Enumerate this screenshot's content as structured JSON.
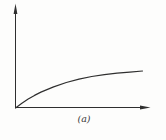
{
  "figure": {
    "caption": "(a)",
    "background": "#fdfdfc",
    "line_color": "#2f2f2f"
  },
  "chart_data": {
    "type": "line",
    "title": "",
    "xlabel": "",
    "ylabel": "",
    "caption": "(a)",
    "grid": false,
    "ticks": false,
    "legend": false,
    "x_range": [
      0,
      1
    ],
    "y_range": [
      0,
      1
    ],
    "axis_style": "arrows-from-origin",
    "series": [
      {
        "name": "saturating-curve",
        "description": "monotonic curve rising from origin and leveling off",
        "x": [
          0,
          0.05,
          0.1,
          0.15,
          0.2,
          0.3,
          0.4,
          0.5,
          0.6,
          0.7,
          0.8,
          0.9,
          1.0
        ],
        "y": [
          0,
          0.13,
          0.24,
          0.34,
          0.43,
          0.57,
          0.69,
          0.78,
          0.85,
          0.9,
          0.94,
          0.97,
          1.0
        ]
      }
    ]
  }
}
